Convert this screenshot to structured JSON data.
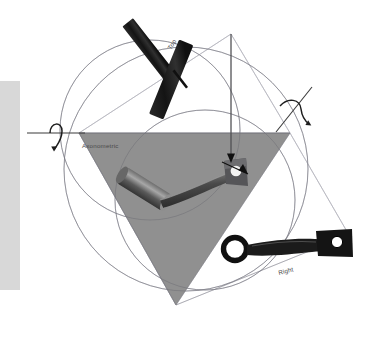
{
  "widget": {
    "name": "View Orientation Trackball",
    "background_color": "#ffffff"
  },
  "panel": {
    "name": "left-panel",
    "color": "#d8d8d8",
    "x": 0,
    "y": 81,
    "width": 20,
    "height": 209
  },
  "geometry": {
    "outer_circle": {
      "cx": 186,
      "cy": 169,
      "r": 122,
      "stroke": "#9a9aa5"
    },
    "upper_circle": {
      "cx": 150,
      "cy": 130,
      "r": 90,
      "stroke": "#9a9aa5"
    },
    "lower_circle": {
      "cx": 205,
      "cy": 200,
      "r": 90,
      "stroke": "#9a9aa5"
    },
    "triangle": {
      "fill": "#8a8a8a",
      "points": "79,133 290,133 176,305"
    },
    "horizon_line": {
      "x1": 79,
      "y1": 133,
      "x2": 290,
      "y2": 133,
      "stroke": "#6f6f78"
    },
    "frame_color": "#b4b4bd"
  },
  "labels": [
    {
      "id": "label-top",
      "text": "Top",
      "x": 171,
      "y": 50,
      "rotation": -58
    },
    {
      "id": "label-axonometric",
      "text": "Axonometric",
      "x": 82,
      "y": 148,
      "rotation": 0
    },
    {
      "id": "label-right",
      "text": "Right",
      "x": 279,
      "y": 275,
      "rotation": -14
    }
  ],
  "rotation_handles": [
    {
      "id": "rotate-handle-left",
      "axis_label": "horizontal-axis",
      "axis": {
        "x1": 28,
        "y1": 133,
        "x2": 84,
        "y2": 133
      },
      "arrow_tip": {
        "x": 55,
        "y": 147
      }
    },
    {
      "id": "rotate-handle-right",
      "axis_label": "diagonal-axis",
      "axis": {
        "x1": 279,
        "y1": 130,
        "x2": 311,
        "y2": 88
      },
      "arrow_tip": {
        "x": 309,
        "y": 124
      }
    },
    {
      "id": "rotate-handle-center",
      "axis_label": "vertical-axis",
      "axis": {
        "x1": 231,
        "y1": 34,
        "x2": 231,
        "y2": 160
      },
      "arrow_tip": {
        "x": 231,
        "y": 160
      }
    }
  ],
  "objects": [
    {
      "id": "object-top-view",
      "name": "crank-top-silhouette",
      "projection": "Top",
      "color": "#1b1b1b"
    },
    {
      "id": "object-axonometric-view",
      "name": "crank-axonometric-shaded",
      "projection": "Axonometric",
      "color": "#3a3a3a"
    },
    {
      "id": "object-right-view",
      "name": "crank-right-silhouette",
      "projection": "Right",
      "color": "#1b1b1b"
    }
  ],
  "colors": {
    "triangle_fill": "#8a8a8a",
    "panel_gray": "#d8d8d8",
    "guide_stroke": "#9a9aa5",
    "object_dark": "#1b1b1b",
    "label_text": "#4a4a4a"
  }
}
